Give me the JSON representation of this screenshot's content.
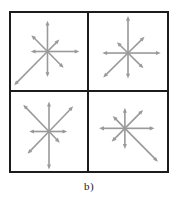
{
  "figure": {
    "caption": "b)",
    "frame_color": "#1c1c1c",
    "background_color": "#ffffff",
    "arrow_color": "#9a9a9a",
    "rows": 2,
    "columns": 2
  },
  "chart_data": {
    "type": "diagram",
    "title": "b)",
    "xlabel": "",
    "ylabel": "",
    "legend": [],
    "grid": true,
    "panels": [
      {
        "name": "top-left",
        "position": "row1-col1",
        "center": [
          0.48,
          0.5
        ],
        "arrows": [
          {
            "direction": "up",
            "angle_deg": 90,
            "length": 0.4
          },
          {
            "direction": "up-right",
            "angle_deg": 45,
            "length": 0.22
          },
          {
            "direction": "right",
            "angle_deg": 0,
            "length": 0.42
          },
          {
            "direction": "down-right",
            "angle_deg": -45,
            "length": 0.3
          },
          {
            "direction": "down",
            "angle_deg": -90,
            "length": 0.33
          },
          {
            "direction": "down-left",
            "angle_deg": -135,
            "length": 0.62
          },
          {
            "direction": "left",
            "angle_deg": 180,
            "length": 0.22
          },
          {
            "direction": "up-left",
            "angle_deg": 135,
            "length": 0.3
          }
        ]
      },
      {
        "name": "top-right",
        "position": "row1-col2",
        "center": [
          0.5,
          0.52
        ],
        "arrows": [
          {
            "direction": "up",
            "angle_deg": 90,
            "length": 0.48
          },
          {
            "direction": "up-right",
            "angle_deg": 45,
            "length": 0.3
          },
          {
            "direction": "right",
            "angle_deg": 0,
            "length": 0.42
          },
          {
            "direction": "down-right",
            "angle_deg": -45,
            "length": 0.28
          },
          {
            "direction": "down",
            "angle_deg": -90,
            "length": 0.33
          },
          {
            "direction": "down-left",
            "angle_deg": -135,
            "length": 0.45
          },
          {
            "direction": "left",
            "angle_deg": 180,
            "length": 0.33
          },
          {
            "direction": "up-left",
            "angle_deg": 135,
            "length": 0.2
          }
        ]
      },
      {
        "name": "bottom-left",
        "position": "row2-col1",
        "center": [
          0.5,
          0.5
        ],
        "arrows": [
          {
            "direction": "up",
            "angle_deg": 90,
            "length": 0.38
          },
          {
            "direction": "up-right",
            "angle_deg": 45,
            "length": 0.45
          },
          {
            "direction": "right",
            "angle_deg": 0,
            "length": 0.24
          },
          {
            "direction": "down-right",
            "angle_deg": -45,
            "length": 0.2
          },
          {
            "direction": "down",
            "angle_deg": -90,
            "length": 0.48
          },
          {
            "direction": "down-left",
            "angle_deg": -135,
            "length": 0.4
          },
          {
            "direction": "left",
            "angle_deg": 180,
            "length": 0.26
          },
          {
            "direction": "up-left",
            "angle_deg": 135,
            "length": 0.48
          }
        ]
      },
      {
        "name": "bottom-right",
        "position": "row2-col2",
        "center": [
          0.46,
          0.46
        ],
        "arrows": [
          {
            "direction": "up",
            "angle_deg": 90,
            "length": 0.26
          },
          {
            "direction": "up-right",
            "angle_deg": 45,
            "length": 0.33
          },
          {
            "direction": "right",
            "angle_deg": 0,
            "length": 0.38
          },
          {
            "direction": "down-right",
            "angle_deg": -45,
            "length": 0.6
          },
          {
            "direction": "down",
            "angle_deg": -90,
            "length": 0.26
          },
          {
            "direction": "down-left",
            "angle_deg": -135,
            "length": 0.24
          },
          {
            "direction": "left",
            "angle_deg": 180,
            "length": 0.33
          },
          {
            "direction": "up-left",
            "angle_deg": 135,
            "length": 0.22
          }
        ]
      }
    ]
  }
}
